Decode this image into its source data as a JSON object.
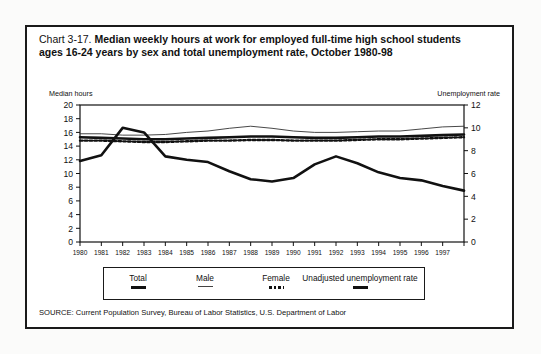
{
  "figure": {
    "chart_number": "Chart 3-17.",
    "title": "Median weekly hours at work for employed full-time high school students ages 16-24 years by sex and total unemployment rate, October 1980-98",
    "source": "SOURCE: Current Population Survey, Bureau of Labor Statistics, U.S. Department of Labor"
  },
  "chart_data": {
    "type": "line",
    "title": "Median weekly hours at work for employed full-time high school students ages 16-24 years by sex and total unemployment rate, October 1980-98",
    "xlabel": "",
    "ylabel": "Median hours",
    "y2label": "Unemployment rate",
    "ylim": [
      0,
      20
    ],
    "y2lim": [
      0,
      12
    ],
    "yticks": [
      0,
      2,
      4,
      6,
      8,
      10,
      12,
      14,
      16,
      18,
      20
    ],
    "y2ticks": [
      0,
      2,
      4,
      6,
      8,
      10,
      12
    ],
    "grid": false,
    "legend_position": "bottom",
    "x": [
      1980,
      1981,
      1982,
      1983,
      1984,
      1985,
      1986,
      1987,
      1988,
      1989,
      1990,
      1991,
      1992,
      1993,
      1994,
      1995,
      1996,
      1997,
      1998
    ],
    "xticklabels": [
      "1980",
      "1981",
      "1982",
      "1983",
      "1984",
      "1985",
      "1986",
      "1987",
      "1988",
      "1989",
      "1990",
      "1991",
      "1992",
      "1993",
      "1994",
      "1995",
      "1996",
      "1997",
      ""
    ],
    "series": [
      {
        "name": "Total",
        "axis": "left",
        "style": "thick-solid",
        "values": [
          15.3,
          15.2,
          15.1,
          15.0,
          15.0,
          15.1,
          15.2,
          15.3,
          15.4,
          15.4,
          15.3,
          15.2,
          15.2,
          15.3,
          15.4,
          15.4,
          15.5,
          15.6,
          15.7
        ]
      },
      {
        "name": "Male",
        "axis": "left",
        "style": "thin-solid",
        "values": [
          15.8,
          15.8,
          15.6,
          15.6,
          15.7,
          16.0,
          16.2,
          16.6,
          16.9,
          16.6,
          16.2,
          16.0,
          16.0,
          16.1,
          16.2,
          16.2,
          16.5,
          16.8,
          16.9
        ]
      },
      {
        "name": "Female",
        "axis": "left",
        "style": "dotted",
        "values": [
          14.8,
          14.8,
          14.7,
          14.6,
          14.6,
          14.7,
          14.8,
          14.8,
          14.9,
          14.9,
          14.8,
          14.8,
          14.8,
          14.9,
          15.0,
          15.0,
          15.1,
          15.2,
          15.3
        ]
      },
      {
        "name": "Unadjusted unemployment rate",
        "axis": "right",
        "style": "thick-solid",
        "values": [
          7.1,
          7.6,
          10.0,
          9.6,
          7.5,
          7.2,
          7.0,
          6.2,
          5.5,
          5.3,
          5.6,
          6.8,
          7.5,
          6.9,
          6.1,
          5.6,
          5.4,
          4.9,
          4.5
        ]
      }
    ],
    "legend": [
      {
        "label": "Total",
        "style": "thick-solid"
      },
      {
        "label": "Male",
        "style": "thin-solid"
      },
      {
        "label": "Female",
        "style": "dotted"
      },
      {
        "label": "Unadjusted unemployment rate",
        "style": "thick-solid"
      }
    ]
  },
  "colors": {
    "ink": "#111111",
    "paper": "#ffffff",
    "border": "#1a1a1a"
  }
}
